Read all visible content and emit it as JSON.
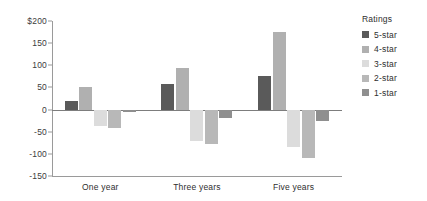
{
  "chart_data": {
    "type": "bar",
    "title": "",
    "subtitle": "",
    "xlabel": "",
    "ylabel": "",
    "categories": [
      "One year",
      "Three years",
      "Five years"
    ],
    "series": [
      {
        "name": "5-star",
        "color": "#5a5a5a",
        "values": [
          20,
          58,
          75
        ]
      },
      {
        "name": "4-star",
        "color": "#b0b0b0",
        "values": [
          50,
          95,
          175
        ]
      },
      {
        "name": "3-star",
        "color": "#dcdcdc",
        "values": [
          -38,
          -72,
          -85
        ]
      },
      {
        "name": "2-star",
        "color": "#b8b8b8",
        "values": [
          -42,
          -78,
          -110
        ]
      },
      {
        "name": "1-star",
        "color": "#8f8f8f",
        "values": [
          -5,
          -18,
          -25
        ]
      }
    ],
    "ylim": [
      -150,
      200
    ],
    "ytick_values": [
      200,
      150,
      100,
      50,
      0,
      -50,
      -100,
      -150
    ],
    "ytick_labels": [
      "$200",
      "150",
      "100",
      "50",
      "0",
      "-50",
      "-100",
      "-150"
    ],
    "grid": false,
    "zero_line": true,
    "legend_position": "right"
  },
  "legend": {
    "title": "Ratings",
    "entries": [
      {
        "label": "5-star",
        "color": "#5a5a5a"
      },
      {
        "label": "4-star",
        "color": "#b0b0b0"
      },
      {
        "label": "3-star",
        "color": "#dcdcdc"
      },
      {
        "label": "2-star",
        "color": "#b8b8b8"
      },
      {
        "label": "1-star",
        "color": "#8f8f8f"
      }
    ]
  },
  "colors": {
    "axis": "#9a9a9a",
    "zero_line": "#7d7d7d",
    "text": "#2e2e2e"
  }
}
